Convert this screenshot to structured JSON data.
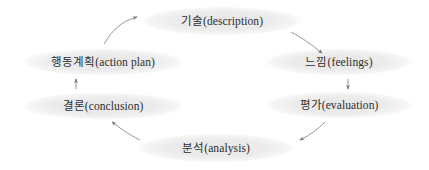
{
  "diagram": {
    "type": "cycle",
    "direction": "clockwise",
    "node_fill": "#ededed",
    "node_text_color": "#2e2e2e",
    "arrow_color": "#8c8c8c",
    "background": "#ffffff",
    "nodes": [
      {
        "id": "description",
        "label": "기술(description)",
        "korean": "기술",
        "english": "description",
        "cx": 222,
        "cy": 21,
        "rx": 84,
        "ry": 15
      },
      {
        "id": "feelings",
        "label": "느낌(feelings)",
        "korean": "느낌",
        "english": "feelings",
        "cx": 339,
        "cy": 62,
        "rx": 77,
        "ry": 14
      },
      {
        "id": "evaluation",
        "label": "평가(evaluation)",
        "korean": "평가",
        "english": "evaluation",
        "cx": 339,
        "cy": 105,
        "rx": 77,
        "ry": 14
      },
      {
        "id": "analysis",
        "label": "분석(analysis)",
        "korean": "분석",
        "english": "analysis",
        "cx": 216,
        "cy": 148,
        "rx": 82,
        "ry": 15
      },
      {
        "id": "conclusion",
        "label": "결론(conclusion)",
        "korean": "결론",
        "english": "conclusion",
        "cx": 103,
        "cy": 106,
        "rx": 85,
        "ry": 14
      },
      {
        "id": "action-plan",
        "label": "행동계획(action plan)",
        "korean": "행동계획",
        "english": "action plan",
        "cx": 103,
        "cy": 62,
        "rx": 85,
        "ry": 14
      }
    ],
    "arrows": [
      {
        "id": "arrow-description-to-feelings",
        "from": "description",
        "to": "feelings",
        "shape": "curve"
      },
      {
        "id": "arrow-feelings-to-evaluation",
        "from": "feelings",
        "to": "evaluation",
        "shape": "straight"
      },
      {
        "id": "arrow-evaluation-to-analysis",
        "from": "evaluation",
        "to": "analysis",
        "shape": "curve"
      },
      {
        "id": "arrow-analysis-to-conclusion",
        "from": "analysis",
        "to": "conclusion",
        "shape": "curve"
      },
      {
        "id": "arrow-conclusion-to-action-plan",
        "from": "conclusion",
        "to": "action-plan",
        "shape": "straight"
      },
      {
        "id": "arrow-action-plan-to-description",
        "from": "action-plan",
        "to": "description",
        "shape": "curve"
      }
    ]
  }
}
